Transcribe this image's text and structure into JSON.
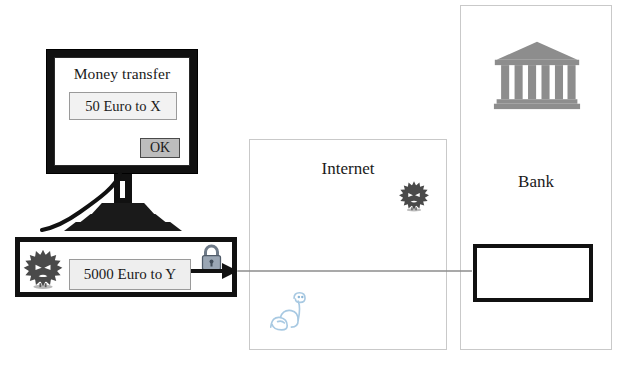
{
  "diagram": {
    "computer": {
      "dialog_title": "Money transfer",
      "displayed_amount": "50 Euro to X",
      "ok_label": "OK",
      "manipulated_amount": "5000 Euro to Y",
      "virus_icon": "virus-icon",
      "lock_icon": "padlock-icon",
      "monitor_icon": "monitor-icon"
    },
    "internet": {
      "label": "Internet",
      "virus_icon": "virus-icon",
      "worm_icon": "worm-icon"
    },
    "bank": {
      "label": "Bank",
      "building_icon": "bank-building-icon",
      "inner_box_value": ""
    },
    "flow": {
      "arrow_name": "transfer-arrow",
      "direction": "computer-to-bank"
    },
    "colors": {
      "outline": "#111111",
      "box_border": "#c9c9c9",
      "field_fill": "#eeeeee",
      "button_fill": "#bdbdbd",
      "lock": "#8e9aa8",
      "worm": "#9fc4e0",
      "bank_building": "#8a8a8a",
      "virus": "#4a4a4a"
    }
  }
}
